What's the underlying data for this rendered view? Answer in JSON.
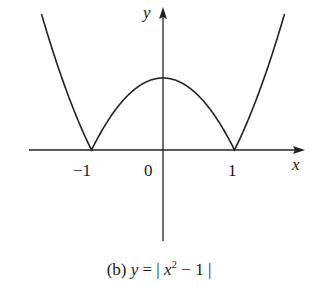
{
  "chart_data": {
    "type": "line",
    "title": "",
    "caption": "(b) y = |x² − 1|",
    "function": "y = |x^2 - 1|",
    "xlabel": "x",
    "ylabel": "y",
    "x_ticks": [
      "−1",
      "0",
      "1"
    ],
    "x_tick_values": [
      -1,
      0,
      1
    ],
    "xlim": [
      -1.88,
      1.99
    ],
    "ylim": [
      -1.26,
      2.0
    ],
    "grid": false,
    "legend": null,
    "series": [
      {
        "name": "|x^2 - 1|",
        "x": [
          -1.7,
          -1.5,
          -1.25,
          -1,
          -0.75,
          -0.5,
          -0.25,
          0,
          0.25,
          0.5,
          0.75,
          1,
          1.25,
          1.5,
          1.7
        ],
        "values": [
          1.89,
          1.25,
          0.5625,
          0,
          0.4375,
          0.75,
          0.9375,
          1,
          0.9375,
          0.75,
          0.4375,
          0,
          0.5625,
          1.25,
          1.89
        ]
      }
    ]
  },
  "labels": {
    "y_axis": "y",
    "x_axis": "x",
    "tick_neg1": "−1",
    "tick_0": "0",
    "tick_1": "1",
    "caption_prefix": "(b) ",
    "caption_y": "y",
    "caption_eq": " = | ",
    "caption_x": "x",
    "caption_sup": "2",
    "caption_rest": " − 1 |"
  }
}
